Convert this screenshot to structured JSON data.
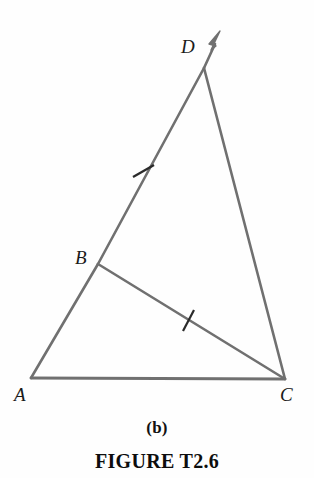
{
  "figure": {
    "panel_label": "(b)",
    "caption": "FIGURE T2.6",
    "background_color": "#fefefe",
    "stroke_color": "#707070",
    "label_color": "#1a1a1a",
    "stroke_width": 2.6
  },
  "diagram": {
    "type": "geometric-construction",
    "points": {
      "A": {
        "label": "A",
        "x": 31,
        "y": 378,
        "label_x": 14,
        "label_y": 385
      },
      "B": {
        "label": "B",
        "x": 98,
        "y": 264,
        "label_x": 75,
        "label_y": 248
      },
      "C": {
        "label": "C",
        "x": 285,
        "y": 379,
        "label_x": 280,
        "label_y": 385
      },
      "D": {
        "label": "D",
        "x": 204,
        "y": 68,
        "label_x": 181,
        "label_y": 37
      }
    },
    "arrow": {
      "name": "ray-AD-arrowhead",
      "tip_x": 220,
      "tip_y": 31,
      "from": "D",
      "direction": "up-right"
    },
    "segments": [
      {
        "name": "segment-AC",
        "from": "A",
        "to": "C",
        "path": "M31,378 L285,379"
      },
      {
        "name": "segment-AB",
        "from": "A",
        "to": "B",
        "path": "M31,378 L98,264"
      },
      {
        "name": "segment-BD",
        "from": "B",
        "to": "D",
        "path": "M98,264 L204,68"
      },
      {
        "name": "segment-DC",
        "from": "D",
        "to": "C",
        "path": "M204,68 L285,379"
      },
      {
        "name": "segment-BC",
        "from": "B",
        "to": "C",
        "path": "M98,264 L285,379"
      }
    ],
    "ray_extension": {
      "name": "ray-beyond-D",
      "path": "M204,68 L214,44"
    },
    "tick_marks": [
      {
        "name": "tick-on-BD",
        "on_segment": "BD",
        "x": 143,
        "y": 171,
        "path": "M134,176 L153,166"
      },
      {
        "name": "tick-on-BC",
        "on_segment": "BC",
        "x": 188,
        "y": 320,
        "path": "M183,330 L193,310"
      }
    ]
  }
}
